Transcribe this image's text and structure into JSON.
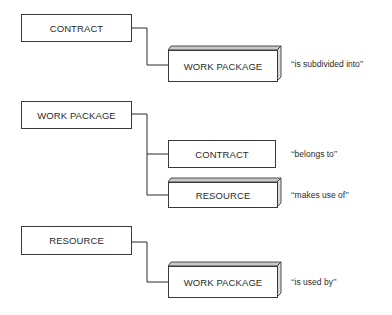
{
  "diagram": {
    "groups": [
      {
        "parent": "CONTRACT",
        "children": [
          {
            "entity": "WORK PACKAGE",
            "style": "3d",
            "relationship": "‘‘is subdivided into’’"
          }
        ]
      },
      {
        "parent": "WORK PACKAGE",
        "children": [
          {
            "entity": "CONTRACT",
            "style": "flat",
            "relationship": "‘‘belongs to’’"
          },
          {
            "entity": "RESOURCE",
            "style": "3d",
            "relationship": "‘‘makes use of’’"
          }
        ]
      },
      {
        "parent": "RESOURCE",
        "children": [
          {
            "entity": "WORK PACKAGE",
            "style": "3d",
            "relationship": "‘‘is used by’’"
          }
        ]
      }
    ],
    "colors": {
      "line": "#2a2a2a",
      "background": "#ffffff",
      "bevel": "#9a9a9a"
    }
  }
}
